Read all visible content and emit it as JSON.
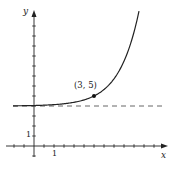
{
  "chart_data": {
    "type": "line",
    "title": "",
    "xlabel": "x",
    "ylabel": "y",
    "x_tick_label": "1",
    "y_tick_label": "1",
    "xlim": [
      -1.5,
      6.5
    ],
    "ylim": [
      -1.2,
      14.5
    ],
    "x_unit_px": 20,
    "y_unit_px": 10,
    "origin_px": [
      34,
      146
    ],
    "grid": false,
    "series": [
      {
        "name": "curve",
        "style": "solid",
        "function": "y = 4 + e^(x-3)",
        "x": [
          -1.05,
          0,
          1,
          2,
          3,
          4,
          5,
          5.25
        ],
        "values": [
          4.02,
          4.05,
          4.14,
          4.37,
          5.0,
          6.72,
          11.39,
          13.49
        ]
      },
      {
        "name": "horizontal asymptote",
        "style": "dashed",
        "function": "y = 4",
        "x": [
          -1.05,
          6.45
        ],
        "values": [
          4,
          4
        ]
      }
    ],
    "annotations": [
      {
        "text": "(3, 5)",
        "x": 3,
        "y": 5,
        "marker": "dot"
      }
    ]
  },
  "labels": {
    "x_axis": "x",
    "y_axis": "y",
    "x_one": "1",
    "y_one": "1",
    "point": "(3, 5)"
  },
  "colors": {
    "ink": "#222222",
    "dash": "#555555"
  }
}
